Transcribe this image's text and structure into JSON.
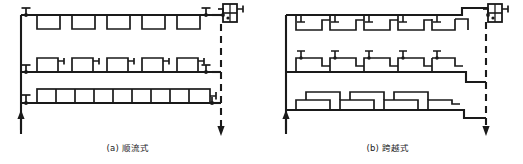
{
  "figure": {
    "kind": "engineering-schematic",
    "stroke_color": "#1a1a1a",
    "background_color": "#ffffff",
    "supply_line_style": "solid",
    "return_line_style": "dashed"
  },
  "panels": [
    {
      "id": "a",
      "caption": "(a) 顺流式",
      "caption_x": 128,
      "caption_y": 141,
      "label": "(a)",
      "name": "顺流式",
      "floors": 3,
      "radiators_per_floor": [
        5,
        5,
        9
      ],
      "riser_arrow_direction": "up",
      "return_arrow_direction": "down",
      "valves": 5,
      "heat_source": "boiler-unit"
    },
    {
      "id": "b",
      "caption": "(b) 跨越式",
      "caption_x": 388,
      "caption_y": 141,
      "label": "(b)",
      "name": "跨越式",
      "floors": 3,
      "radiators_per_floor": [
        5,
        5,
        5
      ],
      "riser_arrow_direction": "up",
      "return_arrow_direction": "down",
      "valves": 16,
      "heat_source": "boiler-unit"
    }
  ],
  "legend": {
    "valve_symbol": "valve-icon",
    "radiator_symbol": "radiator-icon",
    "boiler_symbol": "boiler-icon",
    "supply_arrow_symbol": "arrow-up-icon",
    "return_arrow_symbol": "arrow-down-icon"
  }
}
